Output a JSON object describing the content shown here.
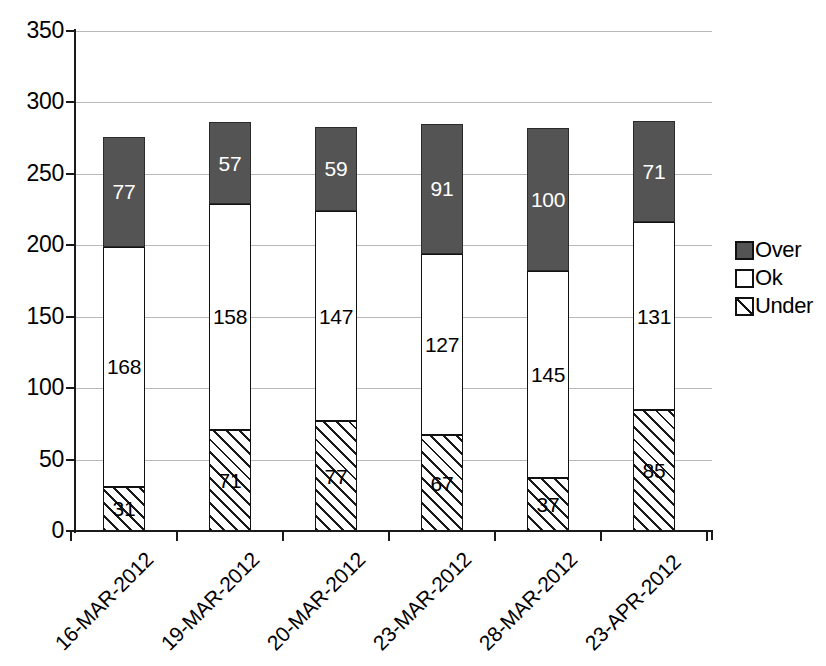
{
  "chart_data": {
    "type": "bar",
    "stacked": true,
    "title": "",
    "xlabel": "",
    "ylabel": "",
    "ylim": [
      0,
      350
    ],
    "ytick_values": [
      0,
      50,
      100,
      150,
      200,
      250,
      300,
      350
    ],
    "ytick_labels": [
      "0",
      "50",
      "100",
      "150",
      "200",
      "250",
      "300",
      "350"
    ],
    "grid": "horizontal",
    "legend_position": "right",
    "categories": [
      "16-MAR-2012",
      "19-MAR-2012",
      "20-MAR-2012",
      "23-MAR-2012",
      "28-MAR-2012",
      "23-APR-2012"
    ],
    "series": [
      {
        "name": "Under",
        "values": [
          31,
          71,
          77,
          67,
          37,
          85
        ],
        "fill": "diagonal-hatch",
        "color": "#ffffff"
      },
      {
        "name": "Ok",
        "values": [
          168,
          158,
          147,
          127,
          145,
          131
        ],
        "fill": "solid",
        "color": "#ffffff"
      },
      {
        "name": "Over",
        "values": [
          77,
          57,
          59,
          91,
          100,
          71
        ],
        "fill": "solid",
        "color": "#545454"
      }
    ],
    "totals": [
      276,
      286,
      283,
      285,
      282,
      287
    ],
    "stack_order_bottom_to_top": [
      "Under",
      "Ok",
      "Over"
    ],
    "legend": [
      {
        "label": "Over",
        "swatch": "over"
      },
      {
        "label": "Ok",
        "swatch": "ok"
      },
      {
        "label": "Under",
        "swatch": "under"
      }
    ],
    "colors": {
      "over": "#545454",
      "ok": "#ffffff",
      "under": "#ffffff",
      "outline": "#111111",
      "gridline": "#b9b9b9",
      "axis": "#1a1a1a",
      "over_label": "#ffffff",
      "ok_label": "#000000",
      "under_label": "#000000"
    }
  }
}
